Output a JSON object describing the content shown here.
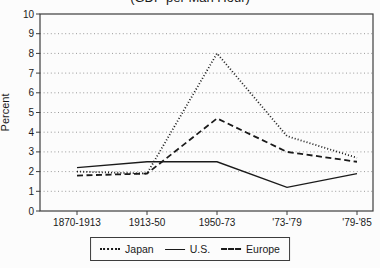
{
  "title": "(GDP per Man Hour)",
  "colors": {
    "line": "#1a1a1a",
    "grid": "#8f8f8f",
    "frame": "#3c3c3c",
    "text": "#1a1a1a",
    "background": "#fcfcfc"
  },
  "chart_data": {
    "type": "line",
    "title": "(GDP per Man Hour)",
    "xlabel": "",
    "ylabel": "Percent",
    "ylim": [
      0,
      10
    ],
    "yticks": [
      0,
      1,
      2,
      3,
      4,
      5,
      6,
      7,
      8,
      9,
      10
    ],
    "grid": true,
    "gridline_style": "dotted",
    "legend_position": "bottom",
    "categories": [
      "1870-1913",
      "1913-50",
      "1950-73",
      "'73-'79",
      "'79-'85"
    ],
    "series": [
      {
        "name": "Japan",
        "line_style": "dotted",
        "values": [
          2.0,
          1.9,
          8.0,
          3.8,
          2.7
        ]
      },
      {
        "name": "U.S.",
        "line_style": "solid",
        "values": [
          2.2,
          2.5,
          2.5,
          1.2,
          1.9
        ]
      },
      {
        "name": "Europe",
        "line_style": "dashed",
        "values": [
          1.8,
          1.9,
          4.7,
          3.0,
          2.5
        ]
      }
    ]
  }
}
